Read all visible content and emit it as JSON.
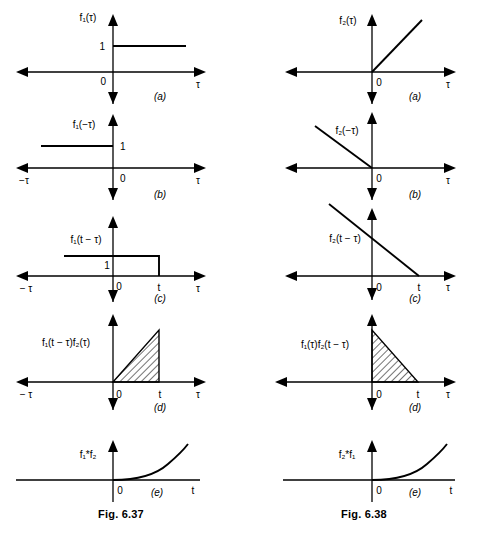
{
  "document": {
    "type": "textbook-figure-pair",
    "description": "Graphical convolution construction shown as two five-panel figure columns"
  },
  "figures": [
    {
      "id": "fig-left",
      "caption": "Fig. 6.37",
      "panels": [
        {
          "key": "a",
          "sublabel": "(a)",
          "function_label": "f₁(τ)",
          "x_axis_label": "τ",
          "x_axis_left_label": "",
          "origin_label": "0",
          "value_label": "1",
          "t_label": "",
          "shape": "step-constant-one-right"
        },
        {
          "key": "b",
          "sublabel": "(b)",
          "function_label": "f₁(−τ)",
          "x_axis_label": "τ",
          "x_axis_left_label": "−τ",
          "origin_label": "0",
          "value_label": "1",
          "t_label": "",
          "shape": "step-constant-one-left"
        },
        {
          "key": "c",
          "sublabel": "(c)",
          "function_label": "f₁(t − τ)",
          "x_axis_label": "τ",
          "x_axis_left_label": "− τ",
          "origin_label": "0",
          "value_label": "1",
          "t_label": "t",
          "shape": "step-one-until-t"
        },
        {
          "key": "d",
          "sublabel": "(d)",
          "function_label": "f₁(t − τ)f₂(τ)",
          "x_axis_label": "τ",
          "x_axis_left_label": "− τ",
          "origin_label": "0",
          "value_label": "",
          "t_label": "t",
          "shape": "hatched-ramp-triangle-rising"
        },
        {
          "key": "e",
          "sublabel": "(e)",
          "function_label": "f₁*f₂",
          "x_axis_label": "t",
          "x_axis_left_label": "",
          "origin_label": "0",
          "value_label": "",
          "t_label": "",
          "shape": "parabola-rising"
        }
      ]
    },
    {
      "id": "fig-right",
      "caption": "Fig. 6.38",
      "panels": [
        {
          "key": "a",
          "sublabel": "(a)",
          "function_label": "f₂(τ)",
          "x_axis_label": "τ",
          "x_axis_left_label": "",
          "origin_label": "0",
          "value_label": "",
          "t_label": "",
          "shape": "ramp-rising-from-origin"
        },
        {
          "key": "b",
          "sublabel": "(b)",
          "function_label": "f₂(−τ)",
          "x_axis_label": "τ",
          "x_axis_left_label": "",
          "origin_label": "0",
          "value_label": "",
          "t_label": "",
          "shape": "ramp-falling-to-origin"
        },
        {
          "key": "c",
          "sublabel": "(c)",
          "function_label": "f₂(t − τ)",
          "x_axis_label": "τ",
          "x_axis_left_label": "",
          "origin_label": "0",
          "value_label": "",
          "t_label": "t",
          "shape": "ramp-falling-crossing-at-t"
        },
        {
          "key": "d",
          "sublabel": "(d)",
          "function_label": "f₁(τ)f₂(t − τ)",
          "x_axis_label": "τ",
          "x_axis_left_label": "",
          "origin_label": "0",
          "value_label": "",
          "t_label": "t",
          "shape": "hatched-triangle-falling"
        },
        {
          "key": "e",
          "sublabel": "(e)",
          "function_label": "f₂*f₁",
          "x_axis_label": "t",
          "x_axis_left_label": "",
          "origin_label": "0",
          "value_label": "",
          "t_label": "",
          "shape": "parabola-rising"
        }
      ]
    }
  ]
}
